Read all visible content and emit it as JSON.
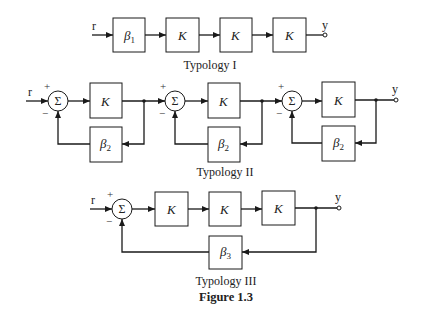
{
  "figure": {
    "caption": "Figure 1.3",
    "input_signal": "r",
    "output_signal": "y",
    "sum_symbol": "Σ",
    "plus": "+",
    "minus": "−"
  },
  "typology1": {
    "title": "Typology I",
    "blocks": [
      {
        "label": "β",
        "sub": "1"
      },
      {
        "label": "K",
        "sub": ""
      },
      {
        "label": "K",
        "sub": ""
      },
      {
        "label": "K",
        "sub": ""
      }
    ]
  },
  "typology2": {
    "title": "Typology II",
    "stages": [
      {
        "forward": "K",
        "feedback": "β",
        "feedback_sub": "2"
      },
      {
        "forward": "K",
        "feedback": "β",
        "feedback_sub": "2"
      },
      {
        "forward": "K",
        "feedback": "β",
        "feedback_sub": "2"
      }
    ]
  },
  "typology3": {
    "title": "Typology III",
    "forward": [
      "K",
      "K",
      "K"
    ],
    "feedback": {
      "label": "β",
      "sub": "3"
    }
  }
}
